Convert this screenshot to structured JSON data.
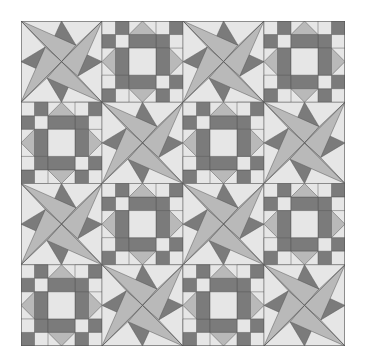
{
  "quilt": {
    "rows": 4,
    "cols": 4,
    "block_px": 81,
    "layout": [
      [
        "star",
        "ninepatch",
        "star",
        "ninepatch"
      ],
      [
        "ninepatch",
        "star",
        "ninepatch",
        "star"
      ],
      [
        "star",
        "ninepatch",
        "star",
        "ninepatch"
      ],
      [
        "ninepatch",
        "star",
        "ninepatch",
        "star"
      ]
    ],
    "colors": {
      "background": "#ffffff",
      "light": "#e6e6e6",
      "medium": "#b9b9b9",
      "dark": "#7b7b7b",
      "outline": "#555555"
    },
    "block_types": {
      "star": "eight-point twisted star with four long blades and four dark mid-edge triangles",
      "ninepatch": "square-in-square nine-patch with checker corners and light-medium triangle points"
    }
  }
}
